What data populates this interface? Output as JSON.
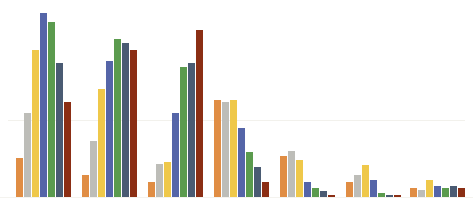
{
  "chart_data": {
    "type": "bar",
    "title": "",
    "subtitle": "",
    "xlabel": "",
    "ylabel": "",
    "grid": true,
    "legend_position": "none",
    "axis_visible": false,
    "tick_labels_visible": false,
    "ylim": [
      0,
      100
    ],
    "categories": [
      "G1",
      "G2",
      "G3",
      "G4",
      "G5",
      "G6",
      "G7"
    ],
    "series": [
      {
        "name": "Series 1",
        "color": "#E08D44",
        "values": [
          21,
          12,
          8,
          52,
          22,
          8,
          5
        ]
      },
      {
        "name": "Series 2",
        "color": "#BDBDB8",
        "values": [
          45,
          30,
          18,
          51,
          25,
          12,
          4
        ]
      },
      {
        "name": "Series 3",
        "color": "#EFC84A",
        "values": [
          79,
          58,
          19,
          52,
          20,
          17,
          9
        ]
      },
      {
        "name": "Series 4",
        "color": "#5565A8",
        "values": [
          99,
          73,
          45,
          37,
          8,
          9,
          6
        ]
      },
      {
        "name": "Series 5",
        "color": "#5B9B4E",
        "values": [
          94,
          85,
          70,
          24,
          5,
          2,
          5
        ]
      },
      {
        "name": "Series 6",
        "color": "#4A5B73",
        "values": [
          72,
          83,
          72,
          16,
          3,
          1,
          6
        ]
      },
      {
        "name": "Series 7",
        "color": "#8B2E14",
        "values": [
          51,
          79,
          90,
          8,
          1,
          1,
          5
        ]
      }
    ],
    "gridlines": [
      41
    ],
    "group_positions": [
      16,
      82,
      148,
      214,
      280,
      346,
      410
    ]
  }
}
